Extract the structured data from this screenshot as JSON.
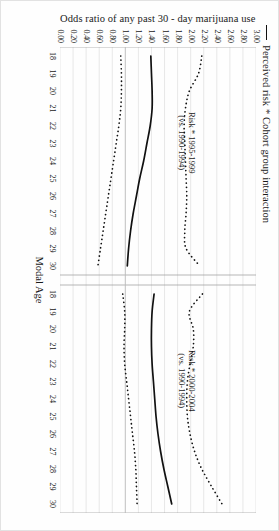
{
  "legend": {
    "marker": "solid-line",
    "label": "Perceived risk * Cohort group interaction"
  },
  "chart_data": {
    "type": "line",
    "title": "",
    "xlabel": "Modal Age",
    "ylabel": "Odds ratio of any past 30 - day marijuana use",
    "ylim": [
      0.0,
      3.0
    ],
    "yticks": [
      "0.00",
      "0.20",
      "0.40",
      "0.60",
      "0.80",
      "1.00",
      "1.20",
      "1.40",
      "1.60",
      "1.80",
      "2.00",
      "2.20",
      "2.40",
      "2.60",
      "2.80",
      "3.00"
    ],
    "ytick_values": [
      0.0,
      0.2,
      0.4,
      0.6,
      0.8,
      1.0,
      1.2,
      1.4,
      1.6,
      1.8,
      2.0,
      2.2,
      2.4,
      2.6,
      2.8,
      3.0
    ],
    "grid": true,
    "reference_line": 1.0,
    "legend_position": "top-left",
    "x": [
      18,
      19,
      20,
      21,
      22,
      23,
      24,
      25,
      26,
      27,
      28,
      29,
      30
    ],
    "panels": [
      {
        "name": "panel-1995-1999",
        "annotation_line1": "Risk * 1995-1999",
        "annotation_line2": "(vs. 1990-1994)",
        "xticks": [
          "18",
          "19",
          "20",
          "21",
          "22",
          "23",
          "24",
          "25",
          "26",
          "27",
          "28",
          "29",
          "30"
        ],
        "series": [
          {
            "name": "Odds ratio estimate",
            "style": "solid",
            "values": [
              1.39,
              1.4,
              1.41,
              1.41,
              1.38,
              1.33,
              1.28,
              1.22,
              1.17,
              1.12,
              1.08,
              1.05,
              1.03
            ]
          },
          {
            "name": "Upper 95% confidence limit",
            "style": "dotted",
            "values": [
              2.17,
              2.12,
              1.98,
              1.92,
              1.9,
              1.91,
              1.92,
              1.93,
              1.94,
              1.93,
              1.91,
              1.93,
              2.14
            ]
          },
          {
            "name": "Lower 95% confidence limit",
            "style": "dotted",
            "values": [
              0.93,
              0.94,
              0.94,
              0.93,
              0.9,
              0.86,
              0.82,
              0.78,
              0.74,
              0.7,
              0.66,
              0.62,
              0.58
            ]
          }
        ]
      },
      {
        "name": "panel-2000-2004",
        "annotation_line1": "Risk * 2000-2004",
        "annotation_line2": "(vs. 1990-1994)",
        "xticks": [
          "18",
          "19",
          "20",
          "21",
          "22",
          "23",
          "24",
          "25",
          "26",
          "27",
          "28",
          "29",
          "30"
        ],
        "series": [
          {
            "name": "Odds ratio estimate",
            "style": "solid",
            "values": [
              1.44,
              1.41,
              1.4,
              1.4,
              1.41,
              1.43,
              1.45,
              1.47,
              1.5,
              1.54,
              1.59,
              1.65,
              1.71
            ]
          },
          {
            "name": "Upper 95% confidence limit",
            "style": "dotted",
            "values": [
              2.18,
              1.98,
              2.04,
              2.04,
              1.99,
              1.95,
              1.94,
              1.95,
              1.99,
              2.06,
              2.17,
              2.32,
              2.48
            ]
          },
          {
            "name": "Lower 95% confidence limit",
            "style": "dotted",
            "values": [
              0.96,
              0.99,
              0.99,
              0.98,
              0.99,
              1.02,
              1.05,
              1.08,
              1.11,
              1.14,
              1.16,
              1.17,
              1.18
            ]
          }
        ]
      }
    ]
  }
}
